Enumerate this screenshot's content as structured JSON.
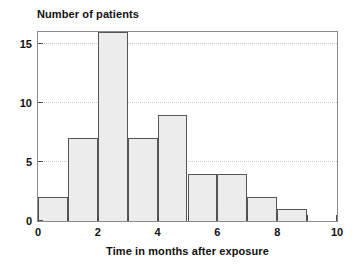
{
  "chart": {
    "title": "",
    "x_axis_title": "Time in months after exposure",
    "y_axis_title": "Number of patients"
  },
  "colors": {
    "bar_fill": "#ececec",
    "bar_stroke": "#555555",
    "frame": "#8a8a8a",
    "gridline": "#c9c9c9",
    "text": "#111111",
    "background": "#ffffff"
  },
  "chart_data": {
    "type": "bar",
    "title": "",
    "xlabel": "Time in months after exposure",
    "ylabel": "Number of patients",
    "xlim": [
      0,
      10
    ],
    "ylim": [
      0,
      16
    ],
    "grid": true,
    "legend": false,
    "bin_width": 1,
    "bin_edges": [
      0,
      1,
      2,
      3,
      4,
      5,
      6,
      7,
      8,
      9,
      10
    ],
    "categories": [
      "0-1",
      "1-2",
      "2-3",
      "3-4",
      "4-5",
      "5-6",
      "6-7",
      "7-8",
      "8-9",
      "9-10"
    ],
    "values": [
      2,
      7,
      16,
      7,
      9,
      4,
      4,
      2,
      1,
      0
    ],
    "x_tick_values": [
      0,
      1,
      2,
      3,
      4,
      5,
      6,
      7,
      8,
      9,
      10
    ],
    "x_tick_labels": [
      "0",
      "",
      "2",
      "",
      "4",
      "",
      "6",
      "",
      "8",
      "",
      "10"
    ],
    "y_tick_values": [
      0,
      5,
      10,
      15
    ],
    "y_tick_labels": [
      "0",
      "5",
      "10",
      "15"
    ],
    "gridline_values": [
      5,
      10,
      15
    ]
  }
}
